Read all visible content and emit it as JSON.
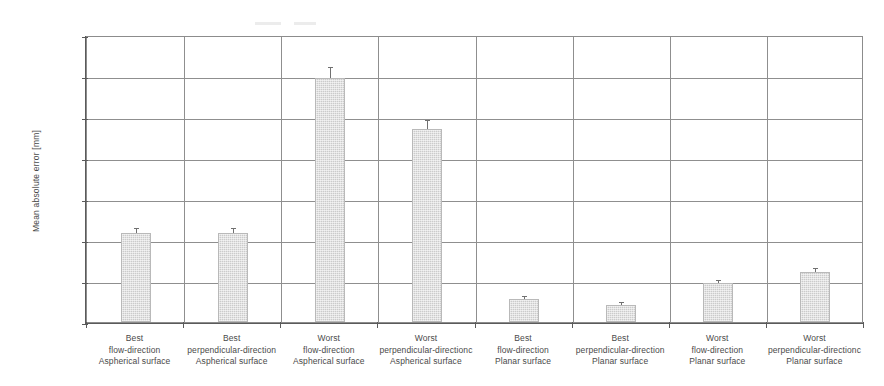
{
  "chart_data": {
    "type": "bar",
    "title": "",
    "subtitle": "",
    "xlabel": "",
    "ylabel": "Mean absolute error  [mm]",
    "ylim": [
      0.0,
      0.035
    ],
    "ytick_values": [
      0.0,
      0.005,
      0.01,
      0.015,
      0.02,
      0.025,
      0.03,
      0.035
    ],
    "ytick_labels": [
      "0.000",
      "0.005",
      "0.010",
      "0.015",
      "0.020",
      "0.025",
      "0.030",
      "0.035"
    ],
    "grid": "horizontal-and-vertical",
    "legend": "none",
    "bar_color": "#cbcbcb",
    "bar_edge_color": "#b9b9b9",
    "axis_color": "#5a5a5a",
    "grid_color": "#8f8f8f",
    "categories": [
      "Best flow-direction Aspherical surface",
      "Best perpendicular-direction Aspherical surface",
      "Worst flow-direction Aspherical surface",
      "Worst perpendicular-directionc Aspherical surface",
      "Best flow-direction Planar surface",
      "Best perpendicular-direction Planar surface",
      "Worst flow-direction Planar surface",
      "Worst perpendicular-directionc Planar surface"
    ],
    "category_lines": [
      [
        "Best",
        "flow-direction",
        "Aspherical surface"
      ],
      [
        "Best",
        "perpendicular-direction",
        "Aspherical surface"
      ],
      [
        "Worst",
        "flow-direction",
        "Aspherical surface"
      ],
      [
        "Worst",
        "perpendicular-directionc",
        "Aspherical surface"
      ],
      [
        "Best",
        "flow-direction",
        "Planar surface"
      ],
      [
        "Best",
        "perpendicular-direction",
        "Planar surface"
      ],
      [
        "Worst",
        "flow-direction",
        "Planar surface"
      ],
      [
        "Worst",
        "perpendicular-directionc",
        "Planar surface"
      ]
    ],
    "values": [
      0.0109,
      0.0108,
      0.0297,
      0.0235,
      0.0028,
      0.0021,
      0.0047,
      0.0061
    ],
    "errors": [
      0.0005,
      0.0005,
      0.0013,
      0.001,
      0.0003,
      0.0002,
      0.0003,
      0.0004
    ]
  }
}
